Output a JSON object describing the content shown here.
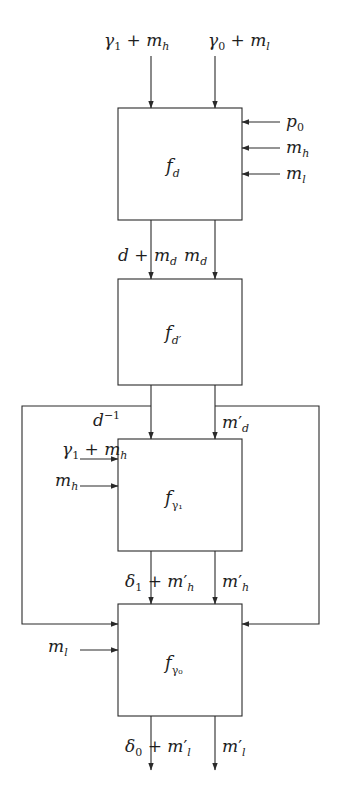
{
  "diagram": {
    "type": "block-diagram",
    "top_cutoff_text": "",
    "blocks": [
      {
        "id": "fd",
        "base": "f",
        "sub": "d"
      },
      {
        "id": "fd_prime",
        "base": "f",
        "sub": "d′"
      },
      {
        "id": "f_gamma1",
        "base": "f",
        "sub": "γ₁"
      },
      {
        "id": "f_gamma0",
        "base": "f",
        "sub": "γ₀"
      }
    ],
    "inputs_top": {
      "left": {
        "a": "γ",
        "a_sub": "1",
        "op": " + ",
        "b": "m",
        "b_sub": "h"
      },
      "right": {
        "a": "γ",
        "a_sub": "0",
        "op": " + ",
        "b": "m",
        "b_sub": "l"
      }
    },
    "inputs_fd_right": [
      {
        "base": "p",
        "sub": "0"
      },
      {
        "base": "m",
        "sub": "h"
      },
      {
        "base": "m",
        "sub": "l"
      }
    ],
    "fd_to_fdprime": {
      "left": {
        "a": "d",
        "op": " + ",
        "b": "m",
        "b_sub": "d"
      },
      "right": {
        "base": "m",
        "sub": "d"
      }
    },
    "fdprime_to_fgamma1": {
      "left": {
        "base": "d",
        "sup": "−1"
      },
      "right": {
        "base": "m",
        "prime": "′",
        "sub": "d"
      }
    },
    "inputs_fgamma1_left": [
      {
        "a": "γ",
        "a_sub": "1",
        "op": " + ",
        "b": "m",
        "b_sub": "h"
      },
      {
        "base": "m",
        "sub": "h"
      }
    ],
    "fgamma1_to_fgamma0": {
      "left": {
        "a": "δ",
        "a_sub": "1",
        "op": " + ",
        "b": "m",
        "b_prime": "′",
        "b_sub": "h"
      },
      "right": {
        "base": "m",
        "prime": "′",
        "sub": "h"
      }
    },
    "inputs_fgamma0_left": [
      {
        "base": "m",
        "sub": "l"
      }
    ],
    "outputs_bottom": {
      "left": {
        "a": "δ",
        "a_sub": "0",
        "op": " + ",
        "b": "m",
        "b_prime": "′",
        "b_sub": "l"
      },
      "right": {
        "base": "m",
        "prime": "′",
        "sub": "l"
      }
    },
    "feedback": [
      {
        "from": "fdprime-left-output",
        "to": "f_gamma0-left",
        "side": "left"
      },
      {
        "from": "fdprime-right-output",
        "to": "f_gamma0-right",
        "side": "right"
      }
    ],
    "colors": {
      "stroke": "#2a2a2a",
      "text": "#1e1e1e",
      "background": "#ffffff"
    }
  }
}
